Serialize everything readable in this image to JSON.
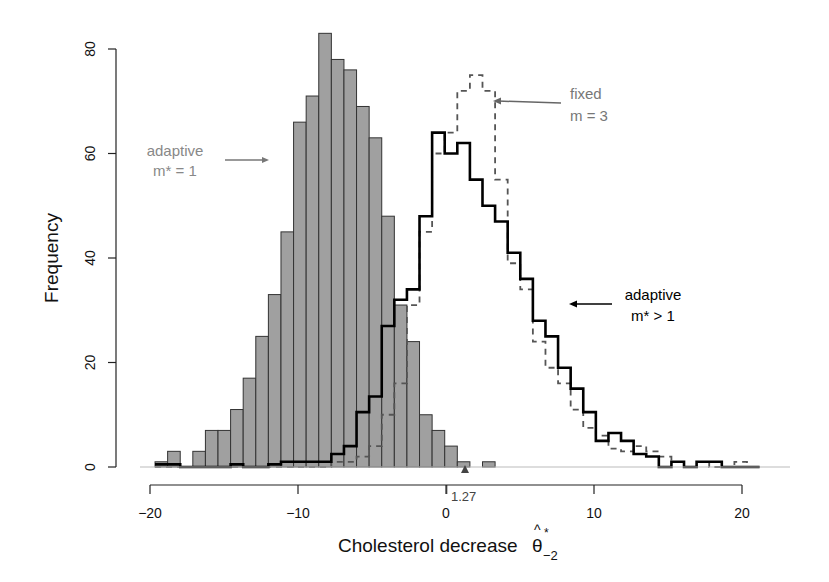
{
  "chart_data": {
    "type": "bar",
    "title": "",
    "xlabel": "Cholesterol decrease θ̂*₋₂",
    "xlabel_main": "Cholesterol decrease",
    "xlabel_symbol": "θ",
    "xlabel_hat": "^",
    "xlabel_sup": "*",
    "xlabel_sub": "−2",
    "ylabel": "Frequency",
    "xlim": [
      -20,
      21.5
    ],
    "ylim": [
      0,
      85
    ],
    "x_ticks": [
      -20,
      -10,
      0,
      10,
      20
    ],
    "x_tick_labels": [
      "−20",
      "−10",
      "0",
      "10",
      "20"
    ],
    "y_ticks": [
      0,
      20,
      40,
      60,
      80
    ],
    "y_tick_labels": [
      "0",
      "20",
      "40",
      "60",
      "80"
    ],
    "grid": false,
    "bin_start": -19.66,
    "bin_width": 0.851,
    "marker": {
      "x": 1.27,
      "label": "1.27",
      "shape": "triangle"
    },
    "series": [
      {
        "name": "adaptive m* = 1",
        "style": "filled-gray-bars",
        "color": "#a0a0a0",
        "values": [
          1,
          3,
          0,
          3,
          7,
          7,
          11,
          17,
          25,
          33,
          45,
          66,
          71,
          83,
          78,
          76,
          69,
          63,
          48,
          31,
          24,
          10,
          7,
          4,
          1,
          0,
          1,
          0,
          0,
          0,
          0,
          0,
          0,
          0,
          0,
          0,
          0,
          0,
          0,
          0,
          0,
          0,
          0,
          0,
          0,
          0,
          0,
          0
        ]
      },
      {
        "name": "fixed m = 3",
        "style": "dashed-step",
        "color": "#555555",
        "values": [
          0,
          0,
          0,
          0,
          0,
          0,
          0,
          0,
          0,
          0,
          0,
          0,
          0,
          0,
          1,
          1,
          2,
          4,
          10,
          16,
          31,
          45,
          60,
          64,
          72,
          75,
          72,
          55,
          39,
          34,
          24,
          19,
          16,
          11,
          7.5,
          6,
          3.5,
          3,
          4,
          3,
          2,
          1,
          0,
          1,
          0,
          0,
          1,
          0
        ]
      },
      {
        "name": "adaptive m* > 1",
        "style": "solid-step",
        "color": "#000000",
        "values": [
          0.5,
          0.5,
          0,
          0,
          0,
          0,
          0.5,
          0,
          0,
          0.5,
          1,
          1,
          1,
          1,
          2.5,
          4,
          10.5,
          13.5,
          27,
          32,
          34,
          48,
          64,
          60,
          62,
          55,
          50,
          47,
          41,
          36,
          28,
          25,
          19,
          15,
          10.5,
          5,
          6.5,
          5,
          2.5,
          2,
          0,
          1,
          0,
          1,
          1,
          0,
          0,
          0
        ]
      }
    ],
    "annotations": [
      {
        "lines": [
          "adaptive",
          "m* = 1"
        ],
        "color": "#888888",
        "points_to": "adaptive m* = 1"
      },
      {
        "lines": [
          "fixed",
          "m = 3"
        ],
        "color": "#777777",
        "points_to": "fixed m = 3"
      },
      {
        "lines": [
          "adaptive",
          "m* > 1"
        ],
        "color": "#000000",
        "points_to": "adaptive m* > 1"
      }
    ]
  }
}
